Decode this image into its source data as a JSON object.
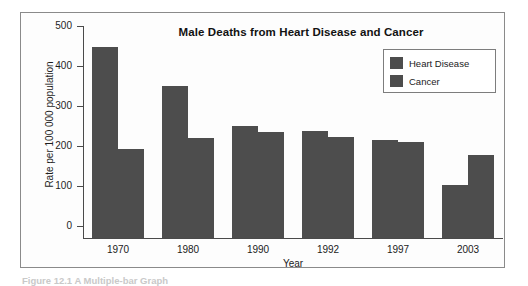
{
  "figure": {
    "caption": "Figure 12.1 A Multiple-bar Graph"
  },
  "legend": {
    "items": [
      {
        "label": "Heart Disease",
        "color": "#4d4d4d",
        "swatch_icon": "color-swatch-icon"
      },
      {
        "label": "Cancer",
        "color": "#4d4d4d",
        "swatch_icon": "color-swatch-icon"
      }
    ]
  },
  "axes": {
    "y_ticks": [
      "500",
      "400",
      "300",
      "200",
      "100",
      "0"
    ],
    "y_title": "Rate per 100 000 population",
    "x_title": "Year"
  },
  "chart_data": {
    "type": "bar",
    "title": "Male Deaths from Heart Disease and Cancer",
    "xlabel": "Year",
    "ylabel": "Rate per 100 000 population",
    "ylim": [
      0,
      500
    ],
    "yticks": [
      0,
      100,
      200,
      300,
      400,
      500
    ],
    "grid": false,
    "legend_position": "top-right",
    "categories": [
      "1970",
      "1980",
      "1990",
      "1992",
      "1997",
      "2003"
    ],
    "series": [
      {
        "name": "Heart Disease",
        "color": "#4d4d4d",
        "values": [
          477,
          380,
          281,
          268,
          244,
          133
        ]
      },
      {
        "name": "Cancer",
        "color": "#4d4d4d",
        "values": [
          222,
          250,
          265,
          253,
          239,
          208
        ]
      }
    ]
  }
}
